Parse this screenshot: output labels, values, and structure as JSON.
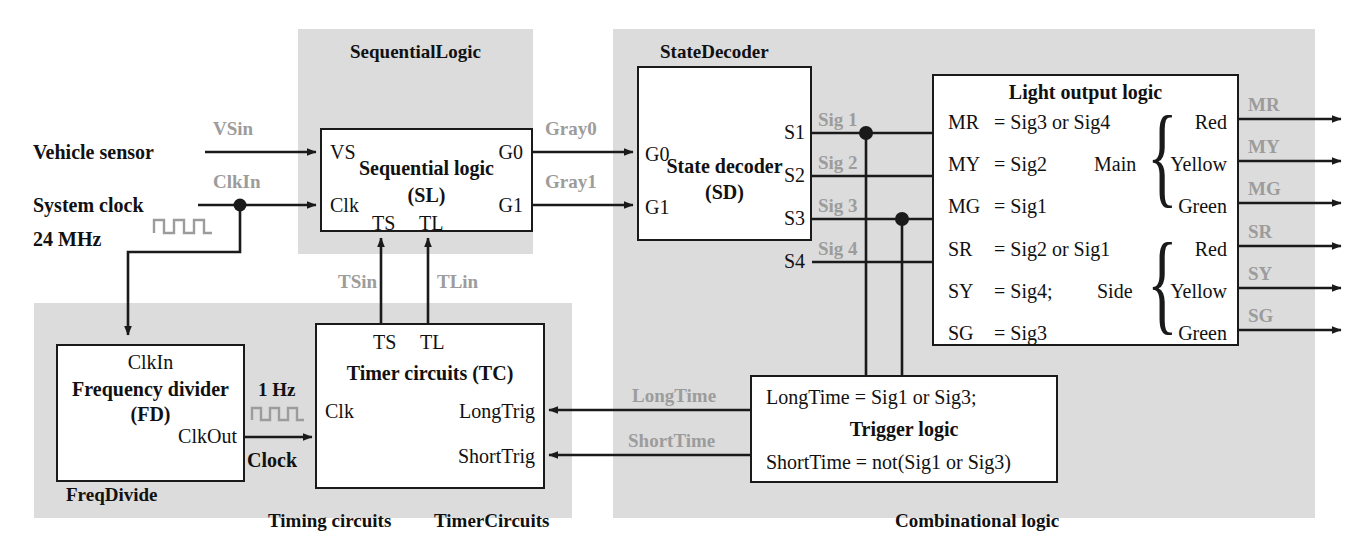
{
  "diagram": {
    "colors": {
      "region_fill": "#dcdcdc",
      "line": "#1a1a1a",
      "signal_label": "#9c9c9c",
      "box_fill": "#ffffff"
    }
  },
  "regions": {
    "sequential": {
      "label": "SequentialLogic"
    },
    "timing": {
      "label": "Timing circuits"
    },
    "freqdivide": {
      "label": "FreqDivide"
    },
    "timercircuits": {
      "label": "TimerCircuits"
    },
    "combinational": {
      "label": "Combinational logic"
    },
    "statedecoder": {
      "label": "StateDecoder"
    }
  },
  "inputs": {
    "vehicle_sensor": "Vehicle sensor",
    "system_clock": "System clock",
    "clock_freq": "24 MHz"
  },
  "sequential_logic_box": {
    "title_line1": "Sequential logic",
    "title_line2": "(SL)",
    "port_vs": "VS",
    "port_clk": "Clk",
    "port_ts": "TS",
    "port_tl": "TL",
    "port_g0": "G0",
    "port_g1": "G1"
  },
  "state_decoder_box": {
    "title_line1": "State decoder",
    "title_line2": "(SD)",
    "port_g0": "G0",
    "port_g1": "G1",
    "port_s1": "S1",
    "port_s2": "S2",
    "port_s3": "S3",
    "port_s4": "S4"
  },
  "light_output_logic": {
    "title": "Light output logic",
    "equations": [
      {
        "name": "MR",
        "eq": "= Sig3 or Sig4"
      },
      {
        "name": "MY",
        "eq": "= Sig2"
      },
      {
        "name": "MG",
        "eq": "= Sig1"
      },
      {
        "name": "SR",
        "eq": "= Sig2 or Sig1"
      },
      {
        "name": "SY",
        "eq": "= Sig4;"
      },
      {
        "name": "SG",
        "eq": "= Sig3"
      }
    ],
    "group_main": "Main",
    "group_side": "Side",
    "lamps": [
      "Red",
      "Yellow",
      "Green",
      "Red",
      "Yellow",
      "Green"
    ],
    "outputs": [
      "MR",
      "MY",
      "MG",
      "SR",
      "SY",
      "SG"
    ]
  },
  "trigger_logic": {
    "title": "Trigger logic",
    "eq_long": "LongTime = Sig1 or Sig3;",
    "eq_short": "ShortTime = not(Sig1 or Sig3)"
  },
  "frequency_divider": {
    "title_line1": "Frequency divider",
    "title_line2": "(FD)",
    "port_clkin": "ClkIn",
    "port_clkout": "ClkOut"
  },
  "timer_circuits": {
    "title": "Timer circuits (TC)",
    "port_ts": "TS",
    "port_tl": "TL",
    "port_clk": "Clk",
    "port_longtrig": "LongTrig",
    "port_shorttrig": "ShortTrig"
  },
  "signals": {
    "vsin": "VSin",
    "clkin": "ClkIn",
    "tsin": "TSin",
    "tlin": "TLin",
    "gray0": "Gray0",
    "gray1": "Gray1",
    "sig1": "Sig 1",
    "sig2": "Sig 2",
    "sig3": "Sig 3",
    "sig4": "Sig 4",
    "longtime": "LongTime",
    "shorttime": "ShortTime",
    "one_hz": "1 Hz",
    "clock": "Clock"
  }
}
